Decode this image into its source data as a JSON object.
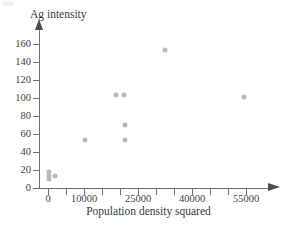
{
  "chart_data": {
    "type": "scatter",
    "title": "",
    "xlabel": "Population density squared",
    "ylabel": "Ag intensity",
    "xlim": [
      0,
      60000
    ],
    "ylim": [
      0,
      170
    ],
    "grid": false,
    "legend": null,
    "marker_color": "#b9b9b9",
    "axis_color": "#6f6f6f",
    "x_ticks_labeled": [
      0,
      10000,
      25000,
      40000,
      55000
    ],
    "x_ticks_minor": [
      5000,
      15000,
      20000,
      30000,
      35000,
      45000,
      50000
    ],
    "y_ticks": [
      0,
      20,
      40,
      60,
      80,
      100,
      120,
      140,
      160
    ],
    "points": [
      {
        "x": 300,
        "y": 18
      },
      {
        "x": 250,
        "y": 13
      },
      {
        "x": 350,
        "y": 10
      },
      {
        "x": 1900,
        "y": 13
      },
      {
        "x": 10200,
        "y": 53
      },
      {
        "x": 19000,
        "y": 103
      },
      {
        "x": 21200,
        "y": 103
      },
      {
        "x": 21300,
        "y": 70
      },
      {
        "x": 21300,
        "y": 53
      },
      {
        "x": 32500,
        "y": 153
      },
      {
        "x": 54500,
        "y": 101
      }
    ]
  },
  "axis": {
    "y_tick_labels": [
      "160",
      "140",
      "120",
      "100",
      "80",
      "60",
      "40",
      "20",
      "0"
    ],
    "x_tick_labels": [
      "0",
      "10000",
      "25000",
      "40000",
      "55000"
    ]
  },
  "labels": {
    "y_axis_title": "Ag intensity",
    "x_axis_title": "Population density squared"
  }
}
